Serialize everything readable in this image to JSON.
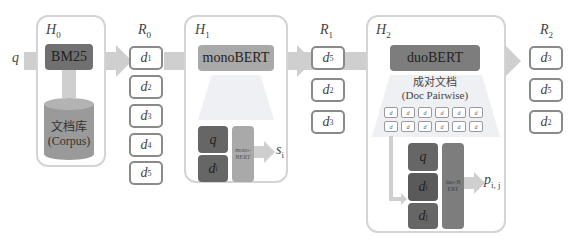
{
  "diagram": {
    "query_label": "q",
    "colors": {
      "arrow": "#cfcfcf",
      "bm25_box": "#707070",
      "corpus": "#9a9a9a",
      "mono_box": "#a9a9a9",
      "duo_box": "#7d7d7d",
      "dark_input": "#666666",
      "stage_border": "#d4d4d4",
      "doc_border": "#8a8a8a",
      "funnel": "#eef0f4"
    },
    "stages": [
      {
        "id": "H0",
        "label": "H",
        "sub": "0",
        "model": "BM25",
        "corpus_zh": "文档库",
        "corpus_en": "(Corpus)"
      },
      {
        "id": "H1",
        "label": "H",
        "sub": "1",
        "model": "monoBERT",
        "inputs": [
          {
            "label": "q",
            "sub": ""
          },
          {
            "label": "d",
            "sub": "i"
          }
        ],
        "inner_model": "mono-BERT",
        "output": {
          "label": "s",
          "sub": "i"
        }
      },
      {
        "id": "H2",
        "label": "H",
        "sub": "2",
        "model": "duoBERT",
        "pairwise_zh": "成对文档",
        "pairwise_en": "(Doc Pairwise)",
        "pair_grid": {
          "rows": 2,
          "cols": 6,
          "cell": "d"
        },
        "inputs": [
          {
            "label": "q",
            "sub": ""
          },
          {
            "label": "d",
            "sub": "i"
          },
          {
            "label": "d",
            "sub": "j"
          }
        ],
        "inner_model": "duo-BERT",
        "output": {
          "label": "p",
          "sub": "i, j"
        }
      }
    ],
    "rankings": [
      {
        "label": "R",
        "sub": "0",
        "docs": [
          {
            "l": "d",
            "s": "1"
          },
          {
            "l": "d",
            "s": "2"
          },
          {
            "l": "d",
            "s": "3"
          },
          {
            "l": "d",
            "s": "4"
          },
          {
            "l": "d",
            "s": "5"
          }
        ]
      },
      {
        "label": "R",
        "sub": "1",
        "docs": [
          {
            "l": "d",
            "s": "5"
          },
          {
            "l": "d",
            "s": "2"
          },
          {
            "l": "d",
            "s": "3"
          }
        ]
      },
      {
        "label": "R",
        "sub": "2",
        "docs": [
          {
            "l": "d",
            "s": "3"
          },
          {
            "l": "d",
            "s": "5"
          },
          {
            "l": "d",
            "s": "2"
          }
        ]
      }
    ]
  }
}
